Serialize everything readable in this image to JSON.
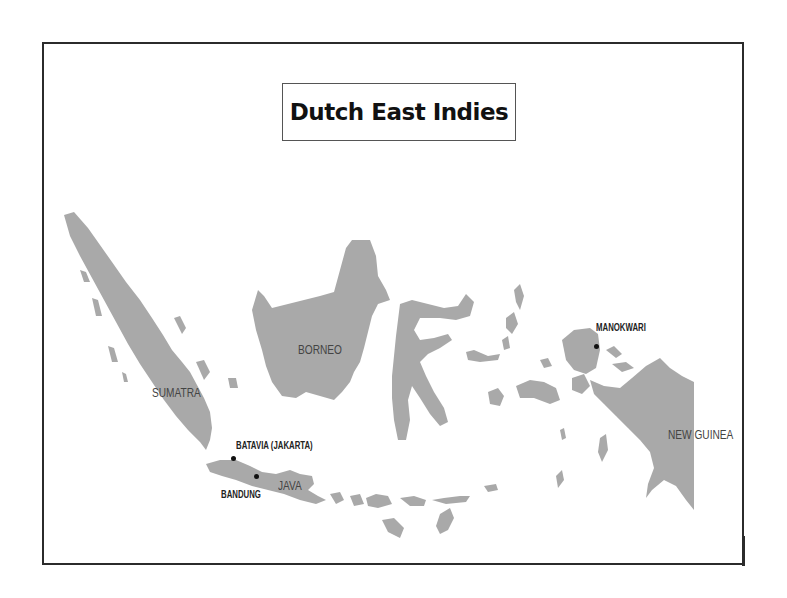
{
  "map": {
    "title": "Dutch East Indies",
    "land_color": "#a9a9a9",
    "frame_color": "#2b2b2b",
    "regions": [
      {
        "id": "sumatra",
        "label": "SUMATRA"
      },
      {
        "id": "borneo",
        "label": "BORNEO"
      },
      {
        "id": "java",
        "label": "JAVA"
      },
      {
        "id": "new-guinea",
        "label": "NEW GUINEA"
      }
    ],
    "cities": [
      {
        "id": "batavia",
        "label": "BATAVIA (JAKARTA)"
      },
      {
        "id": "bandung",
        "label": "BANDUNG"
      },
      {
        "id": "manokwari",
        "label": "MANOKWARI"
      }
    ]
  }
}
